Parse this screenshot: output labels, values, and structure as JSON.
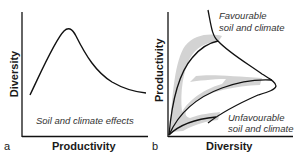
{
  "panels": [
    {
      "letter": "a",
      "x_axis_label": "Productivity",
      "y_axis_label": "Diversity",
      "annotation": "Soil and climate effects",
      "curve": "unimodal hump: diversity rises with productivity to a peak then declines"
    },
    {
      "letter": "b",
      "x_axis_label": "Diversity",
      "y_axis_label": "Productivity",
      "annotations": {
        "top": [
          "Favourable",
          "soil and climate"
        ],
        "bottom": [
          "Unfavourable",
          "soil and climate"
        ]
      },
      "curve": "three saturating curves from origin bounded by an envelope; grey shaded bands"
    }
  ],
  "colors": {
    "line": "#111111",
    "shade": "#d4d4d4",
    "background": "#ffffff"
  }
}
